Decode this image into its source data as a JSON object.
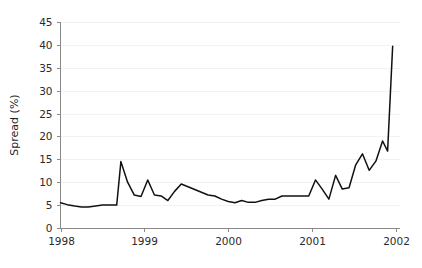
{
  "chart_data": {
    "type": "line",
    "title": "",
    "xlabel": "",
    "ylabel": "Spread (%)",
    "xlim": [
      1998.0,
      2002.0
    ],
    "ylim": [
      0,
      45
    ],
    "grid": true,
    "legend": "none",
    "y_ticks": [
      0,
      5,
      10,
      15,
      20,
      25,
      30,
      35,
      40,
      45
    ],
    "y_tick_labels": [
      "0",
      "5",
      "10",
      "15",
      "20",
      "25",
      "30",
      "35",
      "40",
      "45"
    ],
    "x_ticks": [
      1998,
      1999,
      2000,
      2001,
      2002
    ],
    "x_tick_labels": [
      "1998",
      "1999",
      "2000",
      "2001",
      "2002"
    ],
    "series": [
      {
        "name": "Spread",
        "color": "#111111",
        "x": [
          1998.0,
          1998.08,
          1998.17,
          1998.25,
          1998.33,
          1998.42,
          1998.5,
          1998.58,
          1998.67,
          1998.72,
          1998.8,
          1998.88,
          1998.96,
          1999.04,
          1999.12,
          1999.2,
          1999.28,
          1999.36,
          1999.44,
          1999.52,
          1999.6,
          1999.68,
          1999.76,
          1999.84,
          1999.92,
          2000.0,
          2000.08,
          2000.16,
          2000.24,
          2000.32,
          2000.4,
          2000.48,
          2000.56,
          2000.64,
          2000.72,
          2000.8,
          2000.88,
          2000.96,
          2001.04,
          2001.12,
          2001.2,
          2001.28,
          2001.36,
          2001.44,
          2001.52,
          2001.6,
          2001.68,
          2001.76,
          2001.84,
          2001.9,
          2001.96
        ],
        "y": [
          5.5,
          5.1,
          4.8,
          4.6,
          4.6,
          4.8,
          5.0,
          5.0,
          5.0,
          14.5,
          10.0,
          7.2,
          6.9,
          10.5,
          7.2,
          7.0,
          6.0,
          8.0,
          9.6,
          9.0,
          8.4,
          7.8,
          7.2,
          7.0,
          6.3,
          5.8,
          5.5,
          6.0,
          5.6,
          5.6,
          6.0,
          6.3,
          6.3,
          7.0,
          7.0,
          7.0,
          7.0,
          7.0,
          10.5,
          8.5,
          6.3,
          11.5,
          8.5,
          8.8,
          13.8,
          16.2,
          12.6,
          14.6,
          19.0,
          16.8,
          39.7
        ]
      }
    ]
  }
}
